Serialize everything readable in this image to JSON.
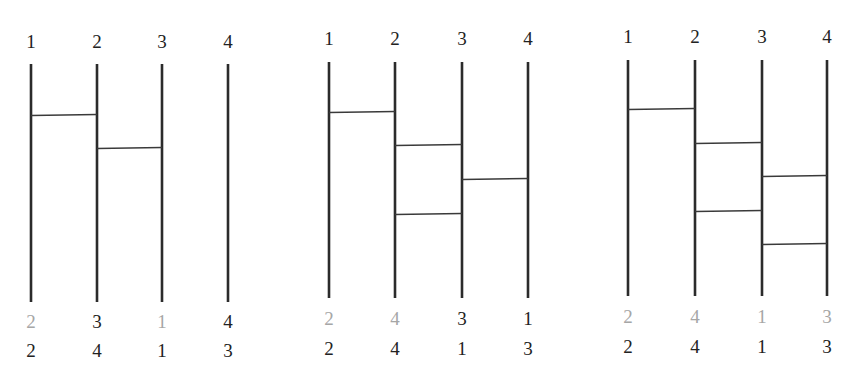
{
  "diagram": {
    "type": "ladder-permutation (amidakuji)",
    "colors": {
      "line": "#2b2b2b",
      "rung": "#3a3a3a",
      "label_text": "#222222",
      "match_text": "#a6a6a6"
    },
    "panels": [
      {
        "name": "panel-1",
        "top_labels": [
          "1",
          "2",
          "3",
          "4"
        ],
        "rungs": [
          {
            "from": 1,
            "to": 2,
            "level": 1
          },
          {
            "from": 2,
            "to": 3,
            "level": 2
          }
        ],
        "result_labels": [
          {
            "text": "2",
            "matches_target": true
          },
          {
            "text": "3",
            "matches_target": false
          },
          {
            "text": "1",
            "matches_target": true
          },
          {
            "text": "4",
            "matches_target": false
          }
        ],
        "target_labels": [
          "2",
          "4",
          "1",
          "3"
        ]
      },
      {
        "name": "panel-2",
        "top_labels": [
          "1",
          "2",
          "3",
          "4"
        ],
        "rungs": [
          {
            "from": 1,
            "to": 2,
            "level": 1
          },
          {
            "from": 2,
            "to": 3,
            "level": 2
          },
          {
            "from": 3,
            "to": 4,
            "level": 3
          },
          {
            "from": 2,
            "to": 3,
            "level": 4
          }
        ],
        "result_labels": [
          {
            "text": "2",
            "matches_target": true
          },
          {
            "text": "4",
            "matches_target": true
          },
          {
            "text": "3",
            "matches_target": false
          },
          {
            "text": "1",
            "matches_target": false
          }
        ],
        "target_labels": [
          "2",
          "4",
          "1",
          "3"
        ]
      },
      {
        "name": "panel-3",
        "top_labels": [
          "1",
          "2",
          "3",
          "4"
        ],
        "rungs": [
          {
            "from": 1,
            "to": 2,
            "level": 1
          },
          {
            "from": 2,
            "to": 3,
            "level": 2
          },
          {
            "from": 3,
            "to": 4,
            "level": 3
          },
          {
            "from": 2,
            "to": 3,
            "level": 4
          },
          {
            "from": 3,
            "to": 4,
            "level": 5
          }
        ],
        "result_labels": [
          {
            "text": "2",
            "matches_target": true
          },
          {
            "text": "4",
            "matches_target": true
          },
          {
            "text": "1",
            "matches_target": true
          },
          {
            "text": "3",
            "matches_target": true
          }
        ],
        "target_labels": [
          "2",
          "4",
          "1",
          "3"
        ]
      }
    ]
  }
}
